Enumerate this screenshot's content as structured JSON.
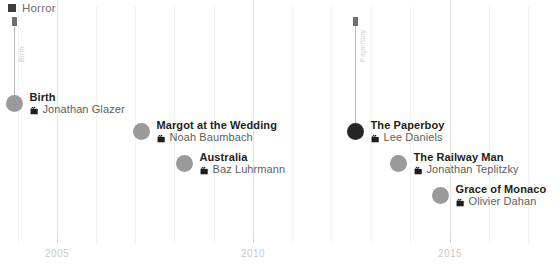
{
  "legend": {
    "items": [
      {
        "label": "Horror",
        "color": "#3c3c3c",
        "marker": "square-marker"
      }
    ]
  },
  "axis": {
    "orientation": "horizontal",
    "tick_labels": [
      "2005",
      "2010",
      "2015"
    ],
    "tick_positions_px": [
      57,
      253,
      450
    ],
    "gridline_positions_px": [
      18,
      57,
      96,
      135,
      174,
      214,
      253,
      292,
      331,
      371,
      410,
      450,
      489,
      528
    ],
    "grid_color": "#f2f2f2",
    "label_color": "#c9c9c9"
  },
  "stems": [
    {
      "name": "stem-left",
      "x_px": 14,
      "top_px": 26,
      "bottom_px": 100,
      "label": "Birth"
    },
    {
      "name": "stem-right",
      "x_px": 355,
      "top_px": 26,
      "bottom_px": 128,
      "label": "Paperboy"
    }
  ],
  "chart_data": {
    "type": "scatter",
    "title": "",
    "xlabel": "",
    "ylabel": "",
    "xlim": [
      2003,
      2016
    ],
    "grid": true,
    "legend_position": "top-left",
    "series": [
      {
        "name": "Horror",
        "color": "#9a9a9a",
        "highlight_color": "#262626",
        "points": [
          {
            "title": "Birth",
            "director": "Jonathan Glazer",
            "x": 2004,
            "x_px": 14,
            "y_px": 100,
            "highlighted": false
          },
          {
            "title": "Margot at the Wedding",
            "director": "Noah Baumbach",
            "x": 2007,
            "x_px": 141,
            "y_px": 128,
            "highlighted": false
          },
          {
            "title": "Australia",
            "director": "Baz Luhrmann",
            "x": 2008,
            "x_px": 184,
            "y_px": 160,
            "highlighted": false
          },
          {
            "title": "The Paperboy",
            "director": "Lee Daniels",
            "x": 2012,
            "x_px": 355,
            "y_px": 128,
            "highlighted": true
          },
          {
            "title": "The Railway Man",
            "director": "Jonathan Teplitzky",
            "x": 2013,
            "x_px": 398,
            "y_px": 160,
            "highlighted": false
          },
          {
            "title": "Grace of Monaco",
            "director": "Olivier Dahan",
            "x": 2014,
            "x_px": 440,
            "y_px": 192,
            "highlighted": false
          }
        ]
      }
    ]
  }
}
